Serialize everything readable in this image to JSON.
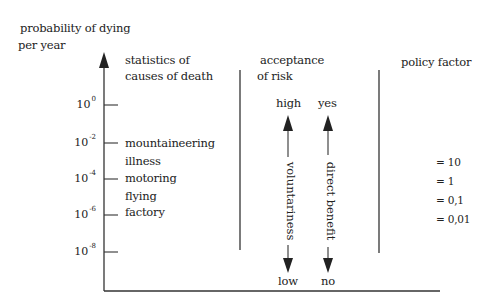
{
  "y_axis": {
    "title_line1": "probability of dying",
    "title_line2": "per year",
    "ticks": [
      {
        "base": "10",
        "exp": "0",
        "y": 105
      },
      {
        "base": "10",
        "exp": "-2",
        "y": 143
      },
      {
        "base": "10",
        "exp": "-4",
        "y": 179
      },
      {
        "base": "10",
        "exp": "-6",
        "y": 215
      },
      {
        "base": "10",
        "exp": "-8",
        "y": 252
      }
    ]
  },
  "columns": {
    "statistics": {
      "header_line1": "statistics of",
      "header_line2": "causes of death",
      "items": [
        "mountaineering",
        "illness",
        "motoring",
        "flying",
        "factory"
      ]
    },
    "acceptance": {
      "header_line1": "acceptance",
      "header_line2": "of risk",
      "voluntariness": {
        "label": "voluntariness",
        "top": "high",
        "bottom": "low"
      },
      "direct_benefit": {
        "label": "direct benefit",
        "top": "yes",
        "bottom": "no"
      }
    },
    "policy": {
      "header": "policy factor",
      "values": [
        "= 10",
        "= 1",
        "= 0,1",
        "= 0,01"
      ]
    }
  },
  "colors": {
    "ink": "#222222",
    "background": "#ffffff"
  }
}
